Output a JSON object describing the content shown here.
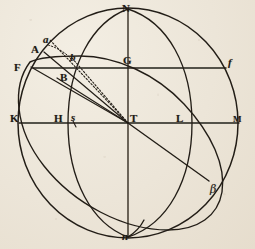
{
  "figure": {
    "caption": "",
    "ink_color": "#241f18",
    "paper_color": "#ece5d8",
    "center_point": "T",
    "circle": {
      "cx": 128,
      "cy": 123,
      "rx": 110,
      "ry": 115
    }
  },
  "labels": [
    {
      "id": "N",
      "text": "N",
      "style": "roman",
      "x": 122,
      "y": 3,
      "note": "north pole / zenith, top of sphere"
    },
    {
      "id": "a",
      "text": "a",
      "style": "ital",
      "x": 43,
      "y": 34,
      "note": "point on outer circle upper-left"
    },
    {
      "id": "A",
      "text": "A",
      "style": "roman",
      "x": 31,
      "y": 44,
      "note": "point on inner meridian upper-left"
    },
    {
      "id": "b",
      "text": "b",
      "style": "ital",
      "x": 70,
      "y": 52,
      "note": "point on tilted great circle"
    },
    {
      "id": "F",
      "text": "F",
      "style": "roman",
      "x": 14,
      "y": 62,
      "note": "left end of upper horizontal chord"
    },
    {
      "id": "G",
      "text": "G",
      "style": "roman",
      "x": 123,
      "y": 55,
      "note": "midpoint of upper horizontal chord on axis"
    },
    {
      "id": "f",
      "text": "f",
      "style": "ital",
      "x": 228,
      "y": 57,
      "note": "right end of upper horizontal chord"
    },
    {
      "id": "B",
      "text": "B",
      "style": "roman",
      "x": 60,
      "y": 72,
      "note": "point below F on tilted circle"
    },
    {
      "id": "K",
      "text": "K",
      "style": "roman",
      "x": 10,
      "y": 113,
      "note": "left end of horizontal diameter"
    },
    {
      "id": "H",
      "text": "H",
      "style": "roman",
      "x": 54,
      "y": 113,
      "note": "left intersection of inner meridian with equator"
    },
    {
      "id": "s",
      "text": "s",
      "style": "ital",
      "x": 71,
      "y": 112,
      "note": "point just right of H on equator"
    },
    {
      "id": "T",
      "text": "T",
      "style": "roman",
      "x": 130,
      "y": 113,
      "note": "centre of the sphere"
    },
    {
      "id": "L",
      "text": "L",
      "style": "roman",
      "x": 176,
      "y": 113,
      "note": "right intersection of second ellipse with equator"
    },
    {
      "id": "M",
      "text": "M",
      "style": "roman",
      "x": 233,
      "y": 115,
      "note": "right end of horizontal diameter"
    },
    {
      "id": "beta",
      "text": "β",
      "style": "greek",
      "x": 210,
      "y": 184,
      "note": "point on tilted great circle lower-right"
    },
    {
      "id": "n",
      "text": "n",
      "style": "ital",
      "x": 122,
      "y": 231,
      "note": "south pole / nadir, bottom of sphere"
    }
  ],
  "geometry": {
    "outer_circle": "main sphere outline",
    "vertical_diameter": "N to n through T",
    "horizontal_diameter": "K to M through T (equator line)",
    "upper_chord": "F to f through G",
    "inner_meridian": "ellipse N-H-n, bulging left",
    "second_meridian": "ellipse N-L-n, bulging right",
    "tilted_great_circle": "ellipse through F, B, beta - the ecliptic",
    "radii": [
      {
        "from": "T",
        "to": "A",
        "style": "solid"
      },
      {
        "from": "T",
        "to": "F",
        "style": "solid"
      },
      {
        "from": "T",
        "to": "B",
        "style": "solid"
      },
      {
        "from": "T",
        "to": "a",
        "style": "dotted"
      },
      {
        "from": "T",
        "to": "b",
        "style": "dotted"
      },
      {
        "from": "T",
        "to": "beta",
        "style": "solid"
      }
    ],
    "tick_marks": [
      {
        "near": "s",
        "orientation": "short oblique stroke"
      }
    ]
  }
}
